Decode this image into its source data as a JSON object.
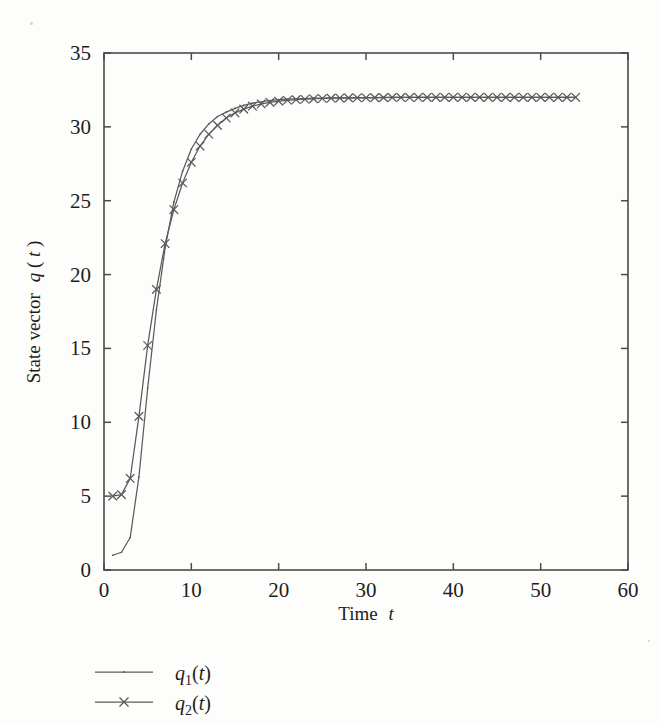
{
  "figure": {
    "background_color": "#fdfdfb",
    "line_color": "#5a5a5a",
    "axis_color": "#4a4a4a",
    "text_color": "#1d1d1d"
  },
  "axis": {
    "x_title_prefix": "Time",
    "x_title_var": "t",
    "y_title_prefix": "State vector",
    "y_title_var": "q",
    "y_title_paren_open": "(",
    "y_title_var2": "t",
    "y_title_paren_close": ")",
    "x_ticks": [
      "0",
      "10",
      "20",
      "30",
      "40",
      "50",
      "60"
    ],
    "y_ticks": [
      "0",
      "5",
      "10",
      "15",
      "20",
      "25",
      "30",
      "35"
    ]
  },
  "legend": {
    "entries": [
      {
        "name": "q",
        "subscript": "1",
        "arg": "(t)",
        "marker": "none"
      },
      {
        "name": "q",
        "subscript": "2",
        "arg": "(t)",
        "marker": "x"
      }
    ]
  },
  "chart_data": {
    "type": "line",
    "title": "",
    "xlabel": "Time t",
    "ylabel": "State vector q(t)",
    "xlim": [
      0,
      60
    ],
    "ylim": [
      0,
      35
    ],
    "xticks": [
      0,
      10,
      20,
      30,
      40,
      50,
      60
    ],
    "yticks": [
      0,
      5,
      10,
      15,
      20,
      25,
      30,
      35
    ],
    "grid": false,
    "legend_position": "below-left",
    "x": [
      1,
      2,
      3,
      4,
      5,
      6,
      7,
      8,
      9,
      10,
      11,
      12,
      13,
      14,
      15,
      16,
      17,
      18,
      19,
      20,
      21,
      22,
      23,
      24,
      25,
      26,
      27,
      28,
      29,
      30,
      31,
      32,
      33,
      34,
      35,
      36,
      37,
      38,
      39,
      40,
      41,
      42,
      43,
      44,
      45,
      46,
      47,
      48,
      49,
      50,
      51,
      52,
      53,
      54
    ],
    "series": [
      {
        "name": "q1(t)",
        "marker": "none",
        "linestyle": "solid",
        "color": "#5a5a5a",
        "values": [
          1.0,
          1.2,
          2.2,
          6.3,
          12.3,
          17.6,
          21.8,
          24.9,
          27.0,
          28.5,
          29.5,
          30.2,
          30.7,
          31.0,
          31.25,
          31.45,
          31.6,
          31.7,
          31.78,
          31.84,
          31.88,
          31.9,
          31.92,
          31.94,
          31.95,
          31.96,
          31.97,
          31.97,
          31.98,
          31.98,
          31.98,
          31.99,
          31.99,
          31.99,
          31.99,
          32.0,
          32.0,
          32.0,
          32.0,
          32.0,
          32.0,
          32.0,
          32.0,
          32.0,
          32.0,
          32.0,
          32.0,
          32.0,
          32.0,
          32.0,
          32.0,
          32.0,
          32.0,
          32.0
        ]
      },
      {
        "name": "q2(t)",
        "marker": "x",
        "linestyle": "solid",
        "color": "#5a5a5a",
        "values": [
          5.0,
          5.1,
          6.2,
          10.4,
          15.2,
          19.0,
          22.1,
          24.4,
          26.2,
          27.6,
          28.7,
          29.5,
          30.1,
          30.6,
          30.95,
          31.2,
          31.4,
          31.55,
          31.66,
          31.74,
          31.8,
          31.84,
          31.87,
          31.9,
          31.92,
          31.94,
          31.95,
          31.96,
          31.97,
          31.97,
          31.98,
          31.98,
          31.99,
          31.99,
          31.99,
          31.99,
          32.0,
          32.0,
          32.0,
          32.0,
          32.0,
          32.0,
          32.0,
          32.0,
          32.0,
          32.0,
          32.0,
          32.0,
          32.0,
          32.0,
          32.0,
          32.0,
          32.0,
          32.0
        ]
      }
    ]
  }
}
